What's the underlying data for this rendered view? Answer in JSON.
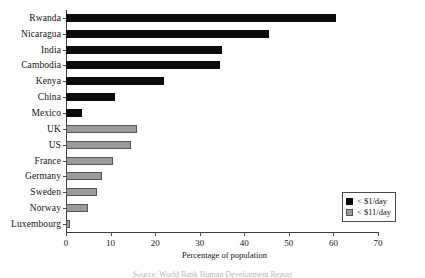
{
  "chart_data": {
    "type": "bar",
    "orientation": "horizontal",
    "title": "",
    "xlabel": "Percentage of population",
    "ylabel": "",
    "xlim": [
      0,
      70
    ],
    "xticks": [
      0,
      10,
      20,
      30,
      40,
      50,
      60,
      70
    ],
    "grid": false,
    "legend_position": "bottom-right",
    "categories": [
      "Rwanda",
      "Nicaragua",
      "India",
      "Cambodia",
      "Kenya",
      "China",
      "Mexico",
      "UK",
      "US",
      "France",
      "Germany",
      "Sweden",
      "Norway",
      "Luxembourg"
    ],
    "series": [
      {
        "name": "< $1/day",
        "color": "#0b0b0b",
        "values": [
          60.5,
          45.5,
          35,
          34.5,
          22,
          11,
          3.5,
          null,
          null,
          null,
          null,
          null,
          null,
          null
        ]
      },
      {
        "name": "< $11/day",
        "color": "#9a9a9a",
        "values": [
          null,
          null,
          null,
          null,
          null,
          null,
          null,
          16,
          14.5,
          10.5,
          8,
          7,
          5,
          1
        ]
      }
    ],
    "bars": [
      {
        "category": "Rwanda",
        "value": 60.5,
        "series": "< $1/day"
      },
      {
        "category": "Nicaragua",
        "value": 45.5,
        "series": "< $1/day"
      },
      {
        "category": "India",
        "value": 35,
        "series": "< $1/day"
      },
      {
        "category": "Cambodia",
        "value": 34.5,
        "series": "< $1/day"
      },
      {
        "category": "Kenya",
        "value": 22,
        "series": "< $1/day"
      },
      {
        "category": "China",
        "value": 11,
        "series": "< $1/day"
      },
      {
        "category": "Mexico",
        "value": 3.5,
        "series": "< $1/day"
      },
      {
        "category": "UK",
        "value": 16,
        "series": "< $11/day"
      },
      {
        "category": "US",
        "value": 14.5,
        "series": "< $11/day"
      },
      {
        "category": "France",
        "value": 10.5,
        "series": "< $11/day"
      },
      {
        "category": "Germany",
        "value": 8,
        "series": "< $11/day"
      },
      {
        "category": "Sweden",
        "value": 7,
        "series": "< $11/day"
      },
      {
        "category": "Norway",
        "value": 5,
        "series": "< $11/day"
      },
      {
        "category": "Luxembourg",
        "value": 1,
        "series": "< $11/day"
      }
    ]
  },
  "axis": {
    "x_title": "Percentage of population",
    "tick_labels": [
      "0",
      "10",
      "20",
      "30",
      "40",
      "50",
      "60",
      "70"
    ]
  },
  "legend": {
    "entries": [
      {
        "label": "< $1/day",
        "color": "#0b0b0b"
      },
      {
        "label": "< $11/day",
        "color": "#9a9a9a"
      }
    ]
  },
  "caption": {
    "text": "Source: World Bank Human Development Report"
  }
}
